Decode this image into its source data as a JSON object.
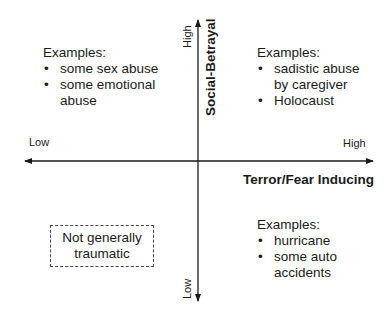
{
  "diagram": {
    "x_axis": {
      "title": "Terror/Fear Inducing",
      "low_label": "Low",
      "high_label": "High"
    },
    "y_axis": {
      "title": "Social-Betrayal",
      "low_label": "Low",
      "high_label": "High"
    },
    "quadrants": {
      "top_left": {
        "heading": "Examples:",
        "items": [
          {
            "lines": [
              "some sex abuse"
            ]
          },
          {
            "lines": [
              "some emotional",
              "abuse"
            ]
          }
        ],
        "bullet": "•"
      },
      "top_right": {
        "heading": "Examples:",
        "items": [
          {
            "lines": [
              "sadistic abuse",
              "by caregiver"
            ]
          },
          {
            "lines": [
              "Holocaust"
            ]
          }
        ],
        "bullet": "•"
      },
      "bottom_right": {
        "heading": "Examples:",
        "items": [
          {
            "lines": [
              "hurricane"
            ]
          },
          {
            "lines": [
              "some auto",
              "accidents"
            ]
          }
        ],
        "bullet": "•"
      },
      "bottom_left": {
        "box_lines": [
          "Not generally",
          "traumatic"
        ]
      }
    },
    "colors": {
      "line": "#1a1a1a",
      "text": "#1a1a1a",
      "background": "#ffffff"
    }
  }
}
